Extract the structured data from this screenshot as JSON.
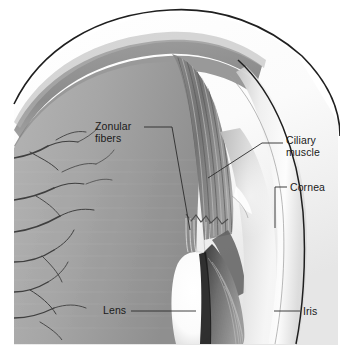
{
  "figure": {
    "style": "grayscale medical illustration",
    "background_color": "#ffffff",
    "label_text_color": "#1a1a1a",
    "leader_line_color": "#2b2b2b"
  },
  "labels": {
    "zonular_fibers": "Zonular\nfibers",
    "ciliary_muscle": "Ciliary\nmuscle",
    "cornea": "Cornea",
    "lens": "Lens",
    "iris": "Iris"
  },
  "structures": [
    {
      "name": "sclera",
      "tone": "#ffffff",
      "description": "outer white coat with dark outline"
    },
    {
      "name": "choroid",
      "tone": "#8d8d8d",
      "description": "pigmented band beneath sclera"
    },
    {
      "name": "retina",
      "tone": "#9b9b9b",
      "description": "inner lining band"
    },
    {
      "name": "vitreous",
      "tone": "#a8a8a8",
      "description": "grey interior chamber"
    },
    {
      "name": "ciliary-muscle",
      "tone": "#7a7a7a",
      "description": "striated meridional fibers"
    },
    {
      "name": "zonular-fibers",
      "tone": "#d8d8d8",
      "description": "fine threads from ciliary body to lens"
    },
    {
      "name": "lens",
      "tone": "#ffffff",
      "description": "bright biconvex body"
    },
    {
      "name": "cornea",
      "tone": "#f2f2f2",
      "description": "transparent curved anterior dome"
    },
    {
      "name": "iris",
      "tone": "#6e6e6e",
      "description": "radially striated diaphragm"
    },
    {
      "name": "blood-vessels",
      "tone": "#4a4a4a",
      "description": "branching choroidal vessels"
    }
  ]
}
